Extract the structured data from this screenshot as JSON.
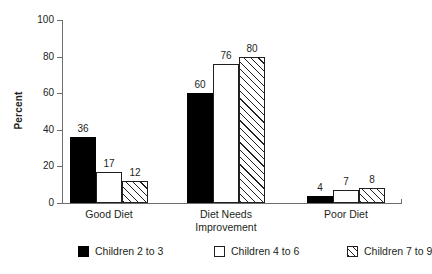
{
  "chart_data": {
    "type": "bar",
    "title": "",
    "subtitle": "",
    "xlabel": "",
    "ylabel": "Percent",
    "ylim": [
      0,
      100
    ],
    "yticks": [
      "0",
      "20",
      "40",
      "60",
      "80",
      "100"
    ],
    "grid": false,
    "legend_position": "bottom",
    "categories": [
      "Good Diet",
      "Diet Needs\nImprovement",
      "Poor Diet"
    ],
    "series": [
      {
        "name": "Children 2 to 3",
        "values": [
          36,
          60,
          4
        ],
        "style": "solid-black",
        "color": "#000000"
      },
      {
        "name": "Children 4 to 6",
        "values": [
          17,
          76,
          7
        ],
        "style": "open-white",
        "color": "#ffffff"
      },
      {
        "name": "Children 7 to 9",
        "values": [
          12,
          80,
          8
        ],
        "style": "diagonal-hatch",
        "color": "#ffffff"
      }
    ],
    "value_labels": [
      [
        "36",
        "17",
        "12"
      ],
      [
        "60",
        "76",
        "80"
      ],
      [
        "4",
        "7",
        "8"
      ]
    ]
  },
  "axis": {
    "y_title": "Percent",
    "y_ticks": [
      {
        "label": "100",
        "value": 100
      },
      {
        "label": "80",
        "value": 80
      },
      {
        "label": "60",
        "value": 60
      },
      {
        "label": "40",
        "value": 40
      },
      {
        "label": "20",
        "value": 20
      },
      {
        "label": "0",
        "value": 0
      }
    ]
  },
  "categories": [
    {
      "line1": "Good Diet",
      "line2": ""
    },
    {
      "line1": "Diet Needs",
      "line2": "Improvement"
    },
    {
      "line1": "Poor Diet",
      "line2": ""
    }
  ],
  "legend": {
    "items": [
      {
        "label": "Children 2 to 3",
        "swatch": "solid-black-swatch"
      },
      {
        "label": "Children 4 to 6",
        "swatch": "open-white-swatch"
      },
      {
        "label": "Children 7 to 9",
        "swatch": "hatched-swatch"
      }
    ]
  },
  "colors": {
    "axis": "#6d6e71",
    "text": "#231f20",
    "series_black": "#000000",
    "series_white": "#ffffff",
    "hatch": "#231f20",
    "background": "#ffffff"
  }
}
